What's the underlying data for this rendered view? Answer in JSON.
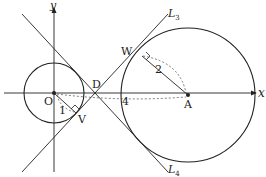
{
  "figure": {
    "axes": {
      "x_label": "x",
      "y_label": "y"
    },
    "points": {
      "origin": "O",
      "center_large": "A",
      "intersection": "D",
      "tangent_point_large": "W",
      "tangent_point_small": "V"
    },
    "lines": {
      "L3": {
        "main": "L",
        "sub": "3"
      },
      "L4": {
        "main": "L",
        "sub": "4"
      }
    },
    "measurements": {
      "radius_small": "1",
      "radius_large": "2",
      "distance_OA": "4"
    },
    "colors": {
      "stroke": "#222222",
      "dashed": "#444444",
      "background": "#ffffff"
    }
  }
}
